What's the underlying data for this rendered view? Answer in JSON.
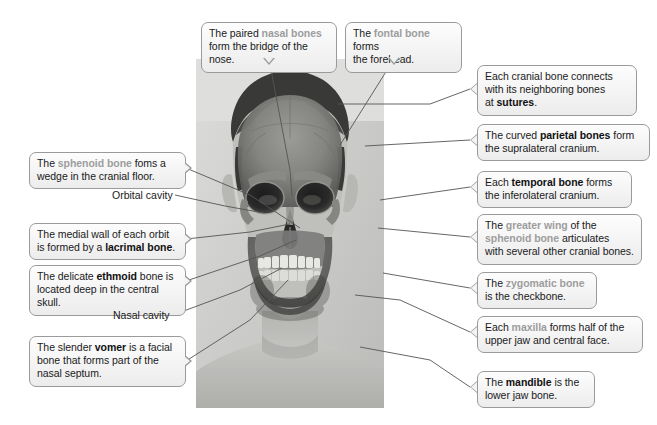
{
  "figure": {
    "type": "anatomy-diagram",
    "image_description": "Grayscale photograph of a man's head and shoulders with a skull superimposed over the face"
  },
  "callouts": [
    {
      "id": "nasal",
      "name": "callout-nasal-bones",
      "lines": [
        [
          {
            "t": "The paired ",
            "s": "n"
          },
          {
            "t": "nasal bones",
            "s": "dim"
          }
        ],
        [
          {
            "t": "form the bridge of the nose.",
            "s": "n"
          }
        ]
      ]
    },
    {
      "id": "frontal",
      "name": "callout-frontal-bone",
      "lines": [
        [
          {
            "t": "The ",
            "s": "n"
          },
          {
            "t": "fontal bone",
            "s": "dim"
          },
          {
            "t": " forms",
            "s": "n"
          }
        ],
        [
          {
            "t": "the forehead.",
            "s": "n"
          }
        ]
      ]
    },
    {
      "id": "sutures",
      "name": "callout-sutures",
      "lines": [
        [
          {
            "t": "Each cranial bone connects",
            "s": "n"
          }
        ],
        [
          {
            "t": "with its neighboring bones",
            "s": "n"
          }
        ],
        [
          {
            "t": "at ",
            "s": "n"
          },
          {
            "t": "sutures",
            "s": "b"
          },
          {
            "t": ".",
            "s": "n"
          }
        ]
      ]
    },
    {
      "id": "parietal",
      "name": "callout-parietal-bones",
      "lines": [
        [
          {
            "t": "The curved ",
            "s": "n"
          },
          {
            "t": "parietal bones",
            "s": "b"
          },
          {
            "t": " form",
            "s": "n"
          }
        ],
        [
          {
            "t": "the supralateral cranium.",
            "s": "n"
          }
        ]
      ]
    },
    {
      "id": "temporal",
      "name": "callout-temporal-bone",
      "lines": [
        [
          {
            "t": "Each ",
            "s": "n"
          },
          {
            "t": "temporal bone",
            "s": "b"
          },
          {
            "t": " forms",
            "s": "n"
          }
        ],
        [
          {
            "t": "the inferolateral cranium.",
            "s": "n"
          }
        ]
      ]
    },
    {
      "id": "greaterwing",
      "name": "callout-greater-wing-sphenoid",
      "lines": [
        [
          {
            "t": "The ",
            "s": "n"
          },
          {
            "t": "greater wing",
            "s": "dim"
          },
          {
            "t": " of the",
            "s": "n"
          }
        ],
        [
          {
            "t": "sphenoid bone",
            "s": "dim"
          },
          {
            "t": " articulates",
            "s": "n"
          }
        ],
        [
          {
            "t": "with several other cranial bones.",
            "s": "n"
          }
        ]
      ]
    },
    {
      "id": "zygomatic",
      "name": "callout-zygomatic-bone",
      "lines": [
        [
          {
            "t": "The ",
            "s": "n"
          },
          {
            "t": "zygomatic bone",
            "s": "dim"
          }
        ],
        [
          {
            "t": "is the checkbone.",
            "s": "n"
          }
        ]
      ]
    },
    {
      "id": "maxilla",
      "name": "callout-maxilla",
      "lines": [
        [
          {
            "t": "Each ",
            "s": "n"
          },
          {
            "t": "maxilla",
            "s": "dim"
          },
          {
            "t": " forms half of the",
            "s": "n"
          }
        ],
        [
          {
            "t": "upper jaw and central face.",
            "s": "n"
          }
        ]
      ]
    },
    {
      "id": "mandible",
      "name": "callout-mandible",
      "lines": [
        [
          {
            "t": "The ",
            "s": "n"
          },
          {
            "t": "mandible",
            "s": "b"
          },
          {
            "t": " is the",
            "s": "n"
          }
        ],
        [
          {
            "t": "lower jaw bone.",
            "s": "n"
          }
        ]
      ]
    },
    {
      "id": "sphenoid",
      "name": "callout-sphenoid-bone",
      "lines": [
        [
          {
            "t": "The ",
            "s": "n"
          },
          {
            "t": "sphenoid bone",
            "s": "dim"
          },
          {
            "t": " foms a",
            "s": "n"
          }
        ],
        [
          {
            "t": "wedge in the cranial floor.",
            "s": "n"
          }
        ]
      ]
    },
    {
      "id": "lacrimal",
      "name": "callout-lacrimal-bone",
      "lines": [
        [
          {
            "t": "The medial wall of each orbit",
            "s": "n"
          }
        ],
        [
          {
            "t": "is formed by a ",
            "s": "n"
          },
          {
            "t": "lacrimal bone",
            "s": "b"
          },
          {
            "t": ".",
            "s": "n"
          }
        ]
      ]
    },
    {
      "id": "ethmoid",
      "name": "callout-ethmoid-bone",
      "lines": [
        [
          {
            "t": "The delicate ",
            "s": "n"
          },
          {
            "t": "ethmoid",
            "s": "b"
          },
          {
            "t": " bone is",
            "s": "n"
          }
        ],
        [
          {
            "t": "located deep in the central skull.",
            "s": "n"
          }
        ]
      ]
    },
    {
      "id": "vomer",
      "name": "callout-vomer",
      "lines": [
        [
          {
            "t": "The slender ",
            "s": "n"
          },
          {
            "t": "vomer",
            "s": "b"
          },
          {
            "t": " is a facial",
            "s": "n"
          }
        ],
        [
          {
            "t": "bone that forms part of the",
            "s": "n"
          }
        ],
        [
          {
            "t": "nasal septum.",
            "s": "n"
          }
        ]
      ]
    }
  ],
  "plain_labels": [
    {
      "id": "orbital",
      "name": "label-orbital-cavity",
      "text": "Orbital cavity"
    },
    {
      "id": "nasalcav",
      "name": "label-nasal-cavity",
      "text": "Nasal cavity"
    }
  ],
  "colors": {
    "box_border": "#9a9a9a",
    "box_fill": "#f2f2f3",
    "text": "#1a1a1a",
    "dim_text": "#9d9d9d",
    "leader_line": "#555555",
    "photo_bg": "#d8d8d6"
  }
}
